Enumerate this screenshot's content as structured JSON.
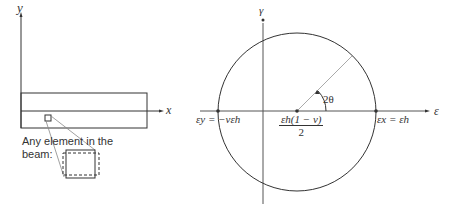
{
  "beam_diagram": {
    "y_axis_label": "y",
    "x_axis_label": "x",
    "caption_line1": "Any element in the",
    "caption_line2": "beam:"
  },
  "mohr_circle": {
    "vertical_axis_label": "γ",
    "horizontal_axis_label": "ε",
    "left_point_label": "εy = −νεh",
    "right_point_label": "εx = εh",
    "center_label_numerator": "εh(1 − ν)",
    "center_label_denominator": "2",
    "angle_label": "2θ"
  },
  "colors": {
    "line": "#333333",
    "radius_line": "#999999",
    "background": "#ffffff"
  }
}
